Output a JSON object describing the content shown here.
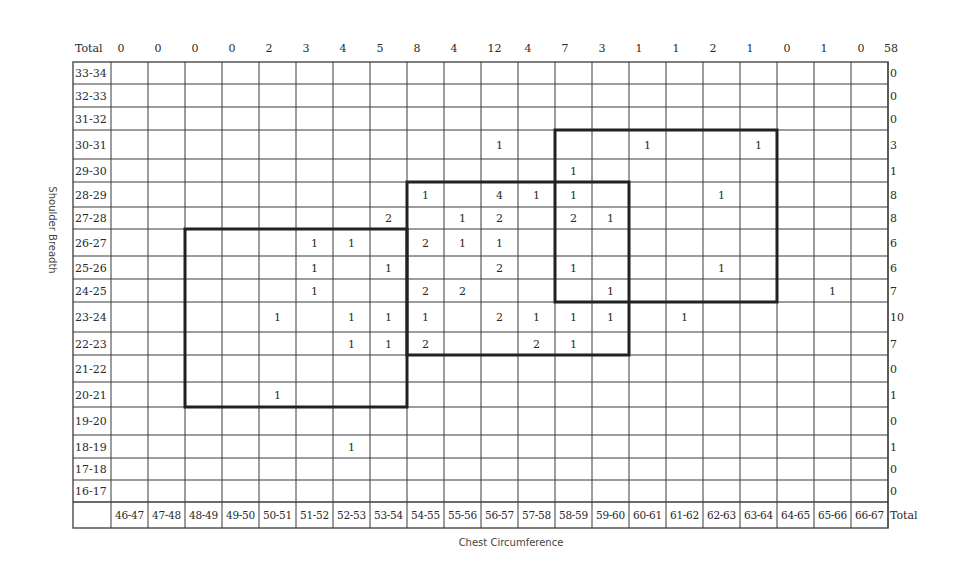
{
  "chart_data": {
    "type": "table",
    "title": "",
    "xlabel": "Chest Circumference",
    "ylabel": "Shoulder Breadth",
    "col_header_label": "Total",
    "row_total_label": "Total",
    "columns": [
      "46-47",
      "47-48",
      "48-49",
      "49-50",
      "50-51",
      "51-52",
      "52-53",
      "53-54",
      "54-55",
      "55-56",
      "56-57",
      "57-58",
      "58-59",
      "59-60",
      "60-61",
      "61-62",
      "62-63",
      "63-64",
      "64-65",
      "65-66",
      "66-67"
    ],
    "column_totals": [
      0,
      0,
      0,
      0,
      2,
      3,
      4,
      5,
      8,
      4,
      12,
      4,
      7,
      3,
      1,
      1,
      2,
      1,
      0,
      1,
      0
    ],
    "grand_total": 58,
    "rows": [
      {
        "label": "33-34",
        "total": 0,
        "cells": {}
      },
      {
        "label": "32-33",
        "total": 0,
        "cells": {}
      },
      {
        "label": "31-32",
        "total": 0,
        "cells": {}
      },
      {
        "label": "30-31",
        "total": 3,
        "cells": {
          "56-57": 1,
          "60-61": 1,
          "63-64": 1
        }
      },
      {
        "label": "29-30",
        "total": 1,
        "cells": {
          "58-59": 1
        }
      },
      {
        "label": "28-29",
        "total": 8,
        "cells": {
          "54-55": 1,
          "56-57": 4,
          "57-58": 1,
          "58-59": 1,
          "62-63": 1
        }
      },
      {
        "label": "27-28",
        "total": 8,
        "cells": {
          "53-54": 2,
          "55-56": 1,
          "56-57": 2,
          "58-59": 2,
          "59-60": 1
        }
      },
      {
        "label": "26-27",
        "total": 6,
        "cells": {
          "51-52": 1,
          "52-53": 1,
          "54-55": 2,
          "55-56": 1,
          "56-57": 1
        }
      },
      {
        "label": "25-26",
        "total": 6,
        "cells": {
          "51-52": 1,
          "53-54": 1,
          "56-57": 2,
          "58-59": 1,
          "62-63": 1
        }
      },
      {
        "label": "24-25",
        "total": 7,
        "cells": {
          "51-52": 1,
          "54-55": 2,
          "55-56": 2,
          "59-60": 1,
          "65-66": 1
        }
      },
      {
        "label": "23-24",
        "total": 10,
        "cells": {
          "50-51": 1,
          "52-53": 1,
          "53-54": 1,
          "54-55": 1,
          "56-57": 2,
          "57-58": 1,
          "58-59": 1,
          "59-60": 1,
          "61-62": 1
        }
      },
      {
        "label": "22-23",
        "total": 7,
        "cells": {
          "52-53": 1,
          "53-54": 1,
          "54-55": 2,
          "57-58": 2,
          "58-59": 1
        }
      },
      {
        "label": "21-22",
        "total": 0,
        "cells": {}
      },
      {
        "label": "20-21",
        "total": 1,
        "cells": {
          "50-51": 1
        }
      },
      {
        "label": "19-20",
        "total": 0,
        "cells": {}
      },
      {
        "label": "18-19",
        "total": 1,
        "cells": {
          "52-53": 1
        }
      },
      {
        "label": "17-18",
        "total": 0,
        "cells": {}
      },
      {
        "label": "16-17",
        "total": 0,
        "cells": {}
      }
    ],
    "highlight_boxes": [
      {
        "name": "lower-left",
        "cols": [
          "48-49",
          "54-55"
        ],
        "rows": [
          "26-27",
          "20-21"
        ]
      },
      {
        "name": "middle",
        "cols": [
          "54-55",
          "60-61"
        ],
        "rows": [
          "28-29",
          "22-23"
        ]
      },
      {
        "name": "upper-right",
        "cols": [
          "58-59",
          "64-65"
        ],
        "rows": [
          "30-31",
          "24-25"
        ]
      }
    ],
    "grid": true
  }
}
